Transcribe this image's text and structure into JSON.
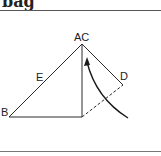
{
  "title": "bag",
  "labels": {
    "ac": "AC",
    "b": "B",
    "d": "D",
    "e": "E"
  },
  "colors": {
    "line": "#2a2a2a",
    "background": "#ffffff"
  }
}
